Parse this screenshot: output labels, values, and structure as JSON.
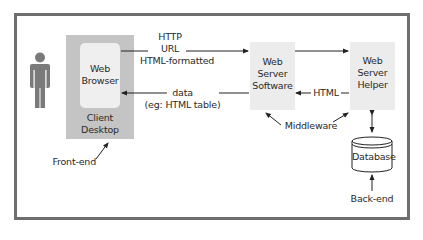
{
  "diagram": {
    "colors": {
      "frame": "#6e6e6e",
      "client_desktop": "#c4c4c4",
      "browser": "#efefef",
      "server_box": "#ececec",
      "person": "#7a7a7a",
      "arrow": "#222222"
    },
    "nodes": {
      "person": {
        "icon": "person-icon"
      },
      "web_browser": {
        "line1": "Web",
        "line2": "Browser"
      },
      "client_desktop": {
        "line1": "Client",
        "line2": "Desktop"
      },
      "web_server_software": {
        "line1": "Web",
        "line2": "Server",
        "line3": "Software"
      },
      "web_server_helper": {
        "line1": "Web",
        "line2": "Server",
        "line3": "Helper"
      },
      "database": {
        "label": "Database"
      }
    },
    "edges": {
      "request": {
        "line1": "HTTP",
        "line2": "URL",
        "line3": "HTML-formatted"
      },
      "response": {
        "line1": "data",
        "line2": "(eg: HTML table)"
      },
      "helper_to_server": {
        "label": "HTML"
      }
    },
    "annotations": {
      "front_end": "Front-end",
      "middleware": "Middleware",
      "back_end": "Back-end"
    }
  }
}
